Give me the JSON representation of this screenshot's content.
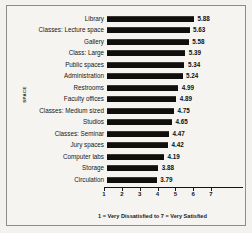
{
  "chart_data": {
    "type": "bar",
    "orientation": "horizontal",
    "title": "",
    "xlabel": "1 = Very Dissatisfied to 7 = Very Satisfied",
    "ylabel": "SPACE",
    "xlim": [
      1,
      7
    ],
    "xticks": [
      1,
      2,
      3,
      4,
      5,
      6,
      7
    ],
    "grid": false,
    "legend": false,
    "bar_color": "#100f0e",
    "background_color": "#f5f4f1",
    "categories": [
      "Library",
      "Classes: Lecture space",
      "Gallery",
      "Class: Large",
      "Public spaces",
      "Administration",
      "Restrooms",
      "Faculty offices",
      "Classes: Medium sized",
      "Studios",
      "Classes: Seminar",
      "Jury spaces",
      "Computer labs",
      "Storage",
      "Circulation"
    ],
    "values": [
      5.88,
      5.63,
      5.58,
      5.39,
      5.34,
      5.24,
      4.99,
      4.89,
      4.75,
      4.65,
      4.47,
      4.42,
      4.19,
      3.88,
      3.79
    ],
    "value_labels": [
      "5.88",
      "5.63",
      "5.58",
      "5.39",
      "5.34",
      "5.24",
      "4.99",
      "4.89",
      "4.75",
      "4.65",
      "4.47",
      "4.42",
      "4.19",
      "3.88",
      "3.79"
    ],
    "xtick_labels": [
      "1",
      "2",
      "3",
      "4",
      "5",
      "6",
      "7"
    ]
  }
}
